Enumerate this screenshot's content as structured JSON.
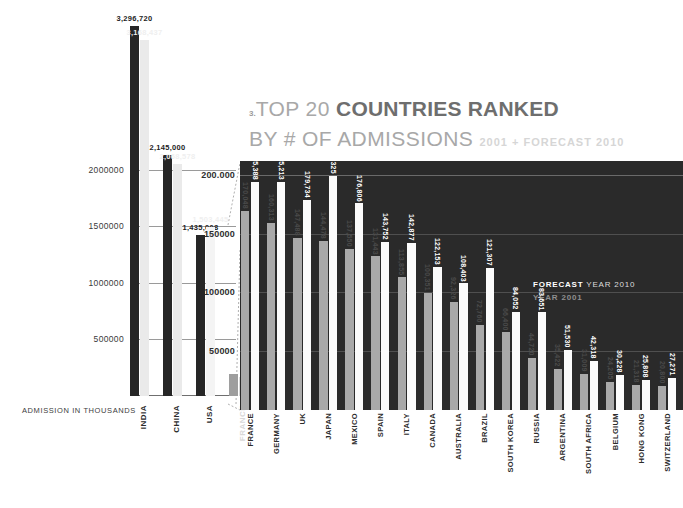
{
  "title": {
    "number": "3.",
    "line1_light": "TOP 20 ",
    "line1_bold": "COUNTRIES RANKED",
    "line2_light": "BY # OF ADMISSIONS",
    "line2_sub": "2001 + FORECAST 2010"
  },
  "legend": {
    "forecast_bold": "FORECAST",
    "forecast_rest": " YEAR 2010",
    "year2001": "YEAR 2001"
  },
  "axis": {
    "inset_title": "ADMISSION IN THOUSANDS",
    "inset_ticks": [
      "500000",
      "1000000",
      "1500000",
      "2000000"
    ],
    "main_ticks": [
      "50000",
      "100000",
      "150000",
      "200.000"
    ]
  },
  "chart_data": {
    "type": "bar",
    "xlabel": "ADMISSION IN THOUSANDS",
    "ylabel": "",
    "grid": true,
    "legend_position": "inside-right",
    "series": [
      {
        "name": "FORECAST YEAR 2010",
        "color": "#fbfbfb"
      },
      {
        "name": "YEAR 2001",
        "color": "#a9a9a9"
      }
    ],
    "inset_panel": {
      "note": "Top 3 countries shown at larger scale (left panel)",
      "ylim": [
        0,
        3400000
      ],
      "ticks": [
        500000,
        1000000,
        1500000,
        2000000
      ],
      "categories": [
        "INDIA",
        "CHINA",
        "USA",
        "FRANCE"
      ],
      "forecast_2010": [
        3296720,
        2145000,
        1435008,
        195388
      ],
      "year_2001": [
        3168437,
        2068578,
        1503445,
        170048
      ],
      "forecast_labels": [
        "3,296,720",
        "2,145,000",
        "1,435,008",
        "195,388"
      ],
      "year_labels": [
        "3,168,437",
        "2,068,578",
        "1,503,445",
        "170,048"
      ]
    },
    "main_panel": {
      "ylim": [
        0,
        213000
      ],
      "ticks": [
        50000,
        100000,
        150000,
        200000
      ],
      "categories": [
        "FRANCE",
        "GERMANY",
        "UK",
        "JAPAN",
        "MEXICO",
        "SPAIN",
        "ITALY",
        "CANADA",
        "AUSTRALIA",
        "BRAZIL",
        "SOUTH KOREA",
        "RUSSIA",
        "ARGENTINA",
        "SOUTH AFRICA",
        "BELGIUM",
        "HONG KONG",
        "SWITZERLAND"
      ],
      "forecast_2010": [
        195388,
        195213,
        179734,
        200325,
        176806,
        143752,
        142877,
        122153,
        108403,
        121307,
        84052,
        83651,
        51530,
        42318,
        30228,
        25808,
        27271
      ],
      "year_2001": [
        170048,
        160313,
        147488,
        144478,
        137550,
        131443,
        113855,
        100351,
        92326,
        72760,
        66400,
        44720,
        35422,
        31009,
        24205,
        21318,
        20800
      ],
      "forecast_labels": [
        "195,388",
        "195,213",
        "179,734",
        "200,325",
        "176,806",
        "143,752",
        "142,877",
        "122,153",
        "108,403",
        "121,307",
        "84,052",
        "83,651",
        "51,530",
        "42,318",
        "30,228",
        "25,808",
        "27,271"
      ],
      "year_labels": [
        "170,048",
        "160,313",
        "147,488",
        "144,478",
        "137,550",
        "131,443",
        "113,855",
        "100,351",
        "92,326",
        "72,760",
        "66,400",
        "44,720",
        "35,422",
        "31,009",
        "24,205",
        "21,318",
        "20,800"
      ]
    }
  }
}
